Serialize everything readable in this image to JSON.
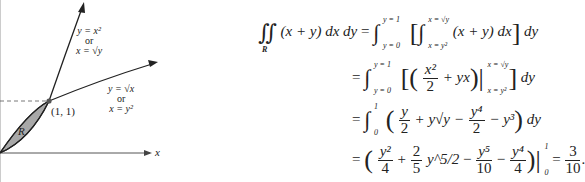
{
  "figure": {
    "curve_upper": {
      "line1": "y = x²",
      "line2": "or",
      "line3": "x = √y"
    },
    "curve_lower": {
      "line1": "y = √x",
      "line2": "or",
      "line3": "x = y²"
    },
    "point_label": "(1, 1)",
    "region_label": "R",
    "x_axis_label": "x",
    "region_fill_color": "#a8a8a8"
  },
  "equations": {
    "line1": {
      "lhs": "(x + y) dx dy",
      "region": "R",
      "outer_upper": "y = 1",
      "outer_lower": "y = 0",
      "inner_upper": "x = √y",
      "inner_lower": "x = y²",
      "integrand": "(x + y) dx",
      "tail": "dy"
    },
    "line2": {
      "upper": "y = 1",
      "lower": "y = 0",
      "frac_num": "x²",
      "frac_den": "2",
      "plus_term": "+ yx",
      "eval_upper": "x = √y",
      "eval_lower": "x = y²",
      "tail": "dy"
    },
    "line3": {
      "upper": "1",
      "lower": "0",
      "t1_num": "y",
      "t1_den": "2",
      "t2": "+ y√y −",
      "t3_num": "y⁴",
      "t3_den": "2",
      "t4": "− y³",
      "tail": "dy"
    },
    "line4": {
      "t1_num": "y²",
      "t1_den": "4",
      "t2_num": "2",
      "t2_den": "5",
      "t2_pow": "y^5/2",
      "t3_num": "y⁵",
      "t3_den": "10",
      "t4_num": "y⁴",
      "t4_den": "4",
      "eval_upper": "1",
      "eval_lower": "0",
      "result_num": "3",
      "result_den": "10"
    }
  }
}
